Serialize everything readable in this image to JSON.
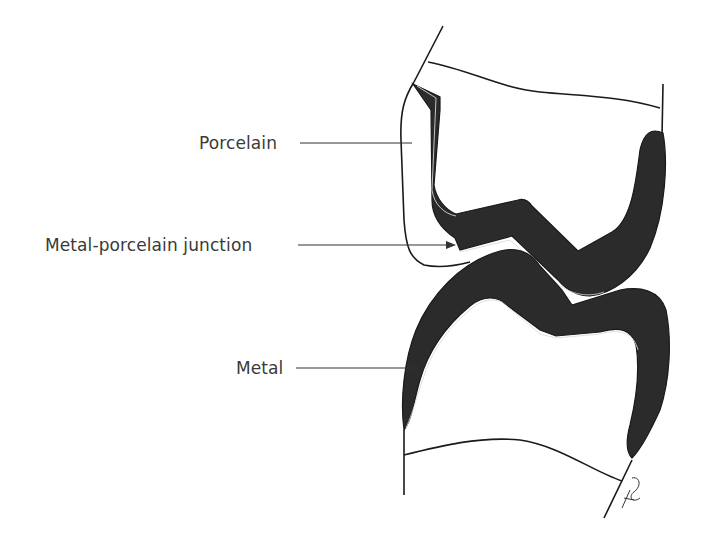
{
  "diagram": {
    "labels": [
      {
        "id": "porcelain",
        "text": "Porcelain"
      },
      {
        "id": "junction",
        "text": "Metal-porcelain junction"
      },
      {
        "id": "metal",
        "text": "Metal"
      }
    ],
    "colors": {
      "metal_fill": "#2b2b2b",
      "outline": "#1a1a1a",
      "label_text": "#3a3a3a",
      "background": "#ffffff"
    }
  }
}
